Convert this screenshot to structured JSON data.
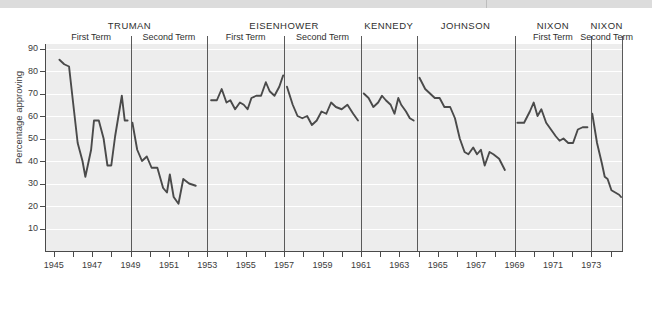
{
  "figure": {
    "ytitle": "Percentage approving"
  },
  "presidents": [
    {
      "name": "TRUMAN",
      "terms": [
        "First Term",
        "Second Term"
      ]
    },
    {
      "name": "EISENHOWER",
      "terms": [
        "First Term",
        "Second Term"
      ]
    },
    {
      "name": "KENNEDY",
      "terms": []
    },
    {
      "name": "JOHNSON",
      "terms": []
    },
    {
      "name": "NIXON",
      "terms": [
        "First Term"
      ]
    },
    {
      "name": "NIXON",
      "terms": [
        "Second Term"
      ]
    }
  ],
  "chart_data": {
    "type": "line",
    "title": "",
    "subtitle": "",
    "xlabel": "",
    "ylabel": "Percentage approving",
    "xlim": [
      1944.6,
      1974.6
    ],
    "ylim": [
      0,
      92
    ],
    "ytick_labels": [
      "10",
      "20",
      "30",
      "40",
      "50",
      "60",
      "70",
      "80",
      "90"
    ],
    "ytick_values": [
      10,
      20,
      30,
      40,
      50,
      60,
      70,
      80,
      90
    ],
    "xtick_labels": [
      "1945",
      "1946",
      "1947",
      "1948",
      "1949",
      "1950",
      "1951",
      "1952",
      "1953",
      "1954",
      "1955",
      "1956",
      "1957",
      "1958",
      "1959",
      "1960",
      "1961",
      "1962",
      "1963",
      "1964",
      "1965",
      "1966",
      "1967",
      "1968",
      "1969",
      "1970",
      "1971",
      "1972",
      "1973",
      "1974"
    ],
    "xtick_labels_shown": [
      "1945",
      "1947",
      "1949",
      "1951",
      "1953",
      "1955",
      "1957",
      "1959",
      "1961",
      "1963",
      "1965",
      "1967",
      "1969",
      "1971",
      "1973"
    ],
    "grid": true,
    "grid_orientation": "horizontal",
    "legend": "none",
    "line_color": "#4a4a4a",
    "plot_background": "#ededed",
    "gridline_color": "#ffffff",
    "term_dividers": [
      1949.0,
      1953.0,
      1957.0,
      1961.0,
      1963.9,
      1969.0,
      1973.0,
      1974.6
    ],
    "series": [
      {
        "name": "Presidential approval",
        "segments": [
          {
            "president": "TRUMAN",
            "term": "First Term",
            "points": [
              [
                1945.3,
                85
              ],
              [
                1945.55,
                83
              ],
              [
                1945.8,
                82
              ],
              [
                1946.05,
                63
              ],
              [
                1946.25,
                48
              ],
              [
                1946.5,
                40
              ],
              [
                1946.65,
                33
              ],
              [
                1946.95,
                45
              ],
              [
                1947.1,
                58
              ],
              [
                1947.35,
                58
              ],
              [
                1947.6,
                50
              ],
              [
                1947.8,
                38
              ],
              [
                1948.0,
                38
              ],
              [
                1948.2,
                51
              ],
              [
                1948.55,
                69
              ],
              [
                1948.7,
                58
              ],
              [
                1948.85,
                58
              ]
            ]
          },
          {
            "president": "TRUMAN",
            "term": "Second Term",
            "points": [
              [
                1949.1,
                57
              ],
              [
                1949.35,
                45
              ],
              [
                1949.6,
                40
              ],
              [
                1949.85,
                42
              ],
              [
                1950.1,
                37
              ],
              [
                1950.4,
                37
              ],
              [
                1950.7,
                28
              ],
              [
                1950.9,
                26
              ],
              [
                1951.05,
                34
              ],
              [
                1951.25,
                24
              ],
              [
                1951.5,
                21
              ],
              [
                1951.75,
                32
              ],
              [
                1952.05,
                30
              ],
              [
                1952.4,
                29
              ]
            ]
          },
          {
            "president": "EISENHOWER",
            "term": "First Term",
            "points": [
              [
                1953.2,
                67
              ],
              [
                1953.5,
                67
              ],
              [
                1953.75,
                72
              ],
              [
                1954.0,
                66
              ],
              [
                1954.2,
                67
              ],
              [
                1954.45,
                63
              ],
              [
                1954.7,
                66
              ],
              [
                1954.9,
                65
              ],
              [
                1955.1,
                63
              ],
              [
                1955.3,
                68
              ],
              [
                1955.55,
                69
              ],
              [
                1955.8,
                69
              ],
              [
                1956.05,
                75
              ],
              [
                1956.25,
                71
              ],
              [
                1956.5,
                69
              ],
              [
                1956.75,
                73
              ],
              [
                1956.95,
                78
              ]
            ]
          },
          {
            "president": "EISENHOWER",
            "term": "Second Term",
            "points": [
              [
                1957.15,
                73
              ],
              [
                1957.45,
                65
              ],
              [
                1957.7,
                60
              ],
              [
                1957.95,
                59
              ],
              [
                1958.2,
                60
              ],
              [
                1958.45,
                56
              ],
              [
                1958.7,
                58
              ],
              [
                1958.95,
                62
              ],
              [
                1959.2,
                61
              ],
              [
                1959.45,
                66
              ],
              [
                1959.7,
                64
              ],
              [
                1960.0,
                63
              ],
              [
                1960.3,
                65
              ],
              [
                1960.6,
                61
              ],
              [
                1960.85,
                58
              ]
            ]
          },
          {
            "president": "KENNEDY",
            "term": "",
            "points": [
              [
                1961.15,
                70
              ],
              [
                1961.4,
                68
              ],
              [
                1961.65,
                64
              ],
              [
                1961.9,
                66
              ],
              [
                1962.1,
                69
              ],
              [
                1962.3,
                67
              ],
              [
                1962.55,
                65
              ],
              [
                1962.75,
                61
              ],
              [
                1962.95,
                68
              ],
              [
                1963.1,
                65
              ],
              [
                1963.35,
                62
              ],
              [
                1963.55,
                59
              ],
              [
                1963.75,
                58
              ]
            ]
          },
          {
            "president": "JOHNSON",
            "term": "",
            "points": [
              [
                1964.05,
                77
              ],
              [
                1964.35,
                72
              ],
              [
                1964.6,
                70
              ],
              [
                1964.85,
                68
              ],
              [
                1965.1,
                68
              ],
              [
                1965.35,
                64
              ],
              [
                1965.65,
                64
              ],
              [
                1965.9,
                59
              ],
              [
                1966.15,
                50
              ],
              [
                1966.4,
                44
              ],
              [
                1966.6,
                43
              ],
              [
                1966.85,
                46
              ],
              [
                1967.05,
                43
              ],
              [
                1967.25,
                45
              ],
              [
                1967.45,
                38
              ],
              [
                1967.7,
                44
              ],
              [
                1967.9,
                43
              ],
              [
                1968.2,
                41
              ],
              [
                1968.5,
                36
              ]
            ]
          },
          {
            "president": "NIXON",
            "term": "First Term",
            "points": [
              [
                1969.15,
                57
              ],
              [
                1969.5,
                57
              ],
              [
                1969.8,
                62
              ],
              [
                1970.0,
                66
              ],
              [
                1970.2,
                60
              ],
              [
                1970.4,
                63
              ],
              [
                1970.65,
                57
              ],
              [
                1970.9,
                54
              ],
              [
                1971.15,
                51
              ],
              [
                1971.35,
                49
              ],
              [
                1971.55,
                50
              ],
              [
                1971.8,
                48
              ],
              [
                1972.05,
                48
              ],
              [
                1972.3,
                54
              ],
              [
                1972.55,
                55
              ],
              [
                1972.8,
                55
              ]
            ]
          },
          {
            "president": "NIXON",
            "term": "Second Term",
            "points": [
              [
                1973.05,
                61
              ],
              [
                1973.3,
                48
              ],
              [
                1973.55,
                39
              ],
              [
                1973.7,
                33
              ],
              [
                1973.85,
                32
              ],
              [
                1974.05,
                27
              ],
              [
                1974.25,
                26
              ],
              [
                1974.45,
                25
              ],
              [
                1974.55,
                24
              ]
            ]
          }
        ]
      }
    ]
  }
}
